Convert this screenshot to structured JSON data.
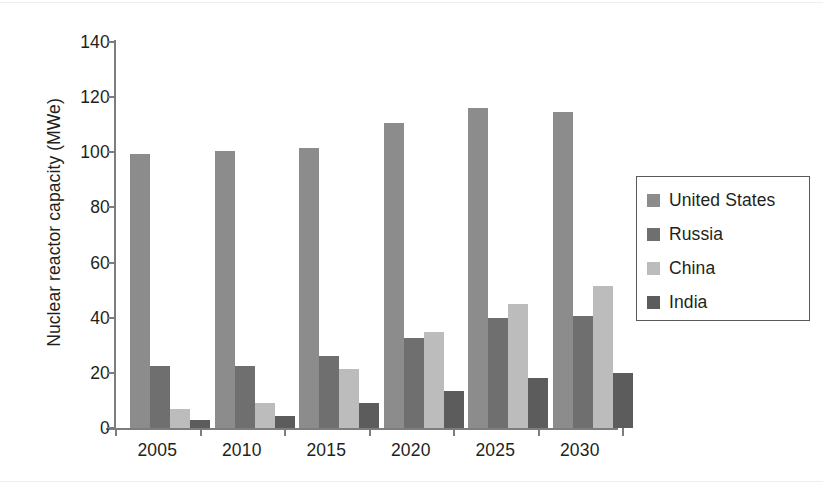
{
  "chart_data": {
    "type": "bar",
    "title": "",
    "xlabel": "",
    "ylabel": "Nuclear reactor capacity (MWe)",
    "categories": [
      "2005",
      "2010",
      "2015",
      "2020",
      "2025",
      "2030"
    ],
    "series": [
      {
        "name": "United States",
        "color": "#8c8c8c",
        "values": [
          99.5,
          100.5,
          101.5,
          110.5,
          116,
          114.5
        ]
      },
      {
        "name": "Russia",
        "color": "#6f6f6f",
        "values": [
          22.5,
          22.5,
          26,
          32.5,
          40,
          40.5
        ]
      },
      {
        "name": "China",
        "color": "#bcbcbc",
        "values": [
          7,
          9,
          21.5,
          35,
          45,
          51.5
        ]
      },
      {
        "name": "India",
        "color": "#5c5c5c",
        "values": [
          3,
          4.5,
          9,
          13.5,
          18,
          20
        ]
      }
    ],
    "ylim": [
      0,
      140
    ],
    "yticks": [
      "0",
      "20",
      "40",
      "60",
      "80",
      "100",
      "120",
      "140"
    ],
    "ytick_values": [
      0,
      20,
      40,
      60,
      80,
      100,
      120,
      140
    ],
    "grid": false,
    "legend_position": "right"
  },
  "axis": {
    "y_title": "Nuclear reactor capacity (MWe)"
  },
  "legend": {
    "entries": [
      {
        "label": "United States",
        "color": "#8c8c8c"
      },
      {
        "label": "Russia",
        "color": "#6f6f6f"
      },
      {
        "label": "China",
        "color": "#bcbcbc"
      },
      {
        "label": "India",
        "color": "#5c5c5c"
      }
    ]
  }
}
